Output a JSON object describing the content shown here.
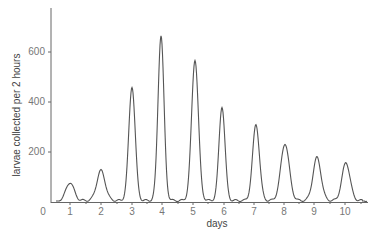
{
  "chart_data": {
    "type": "line",
    "title": "",
    "xlabel": "days",
    "ylabel": "larvae collected per 2 hours",
    "x_ticks": [
      "0",
      "1",
      "2",
      "3",
      "4",
      "5",
      "6",
      "7",
      "8",
      "9",
      "10"
    ],
    "y_ticks": [
      "200",
      "400",
      "600"
    ],
    "xlim": [
      0,
      10.8
    ],
    "ylim": [
      0,
      780
    ],
    "grid": false,
    "legend": null,
    "series": [
      {
        "name": "larvae collected",
        "peaks": [
          {
            "day": 1,
            "value": 72
          },
          {
            "day": 2,
            "value": 120
          },
          {
            "day": 3,
            "value": 456
          },
          {
            "day": 4,
            "value": 660
          },
          {
            "day": 5,
            "value": 564
          },
          {
            "day": 6,
            "value": 376
          },
          {
            "day": 7,
            "value": 304
          },
          {
            "day": 8,
            "value": 228
          },
          {
            "day": 9,
            "value": 172
          },
          {
            "day": 10,
            "value": 152
          }
        ]
      }
    ]
  }
}
